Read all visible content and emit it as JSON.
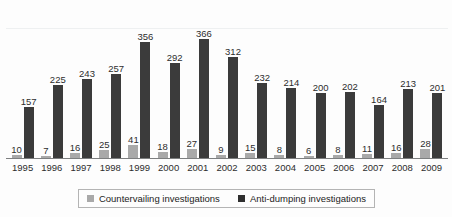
{
  "chart_data": {
    "type": "bar",
    "title": "",
    "subtitle": "",
    "xlabel": "",
    "ylabel": "",
    "ylim": [
      0,
      400
    ],
    "grid": true,
    "legend_position": "bottom",
    "categories": [
      "1995",
      "1996",
      "1997",
      "1998",
      "1999",
      "2000",
      "2001",
      "2002",
      "2003",
      "2004",
      "2005",
      "2006",
      "2007",
      "2008",
      "2009"
    ],
    "series": [
      {
        "name": "Countervailing investigations",
        "color": "#a9a9a9",
        "values": [
          10,
          7,
          16,
          25,
          41,
          18,
          27,
          9,
          15,
          8,
          6,
          8,
          11,
          16,
          28
        ]
      },
      {
        "name": "Anti-dumping investigations",
        "color": "#3b3b3b",
        "values": [
          157,
          225,
          243,
          257,
          356,
          292,
          366,
          312,
          232,
          214,
          200,
          202,
          164,
          213,
          201
        ]
      }
    ],
    "data_labels_shown": true
  },
  "legend": {
    "items": [
      {
        "label": "Countervailing investigations",
        "swatch": "legend-swatch-countervailing"
      },
      {
        "label": "Anti-dumping investigations",
        "swatch": "legend-swatch-antidumping"
      }
    ]
  },
  "colors": {
    "countervailing": "#a9a9a9",
    "antidumping": "#3b3b3b",
    "axis": "#7d7f80",
    "gridline": "#eef0f1",
    "label_text": "#2d2d2d",
    "legend_border": "#b4b4b4",
    "background": "#fdfdfd"
  }
}
